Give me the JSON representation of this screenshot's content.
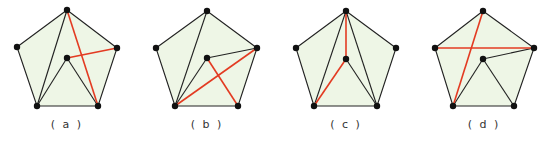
{
  "figure": {
    "colors": {
      "fill": "#eef6e6",
      "edge": "#222222",
      "highlight": "#e33b22",
      "vertex": "#111111"
    },
    "panels": [
      {
        "label": "(a)",
        "label_pos": [
          67,
          128
        ],
        "vertices": {
          "top": [
            67,
            10
          ],
          "left": [
            17,
            47
          ],
          "right": [
            117,
            48
          ],
          "inner": [
            67,
            58
          ],
          "bl": [
            37,
            106
          ],
          "br": [
            98,
            106
          ]
        },
        "polygon": [
          "top",
          "right",
          "br",
          "bl",
          "left"
        ],
        "edges": [
          [
            "top",
            "bl"
          ],
          [
            "inner",
            "bl"
          ],
          [
            "inner",
            "br"
          ]
        ],
        "red_edges": [
          [
            "top",
            "br"
          ],
          [
            "inner",
            "right"
          ]
        ]
      },
      {
        "label": "(b)",
        "label_pos": [
          207,
          128
        ],
        "vertices": {
          "top": [
            207,
            11
          ],
          "left": [
            156,
            48
          ],
          "right": [
            257,
            48
          ],
          "inner": [
            207,
            58
          ],
          "bl": [
            175,
            106
          ],
          "br": [
            238,
            106
          ]
        },
        "polygon": [
          "top",
          "right",
          "br",
          "bl",
          "left"
        ],
        "edges": [
          [
            "top",
            "bl"
          ],
          [
            "inner",
            "bl"
          ],
          [
            "inner",
            "right"
          ]
        ],
        "red_edges": [
          [
            "bl",
            "right"
          ],
          [
            "inner",
            "br"
          ]
        ]
      },
      {
        "label": "(c)",
        "label_pos": [
          346,
          128
        ],
        "vertices": {
          "top": [
            346,
            11
          ],
          "left": [
            296,
            48
          ],
          "right": [
            396,
            48
          ],
          "inner": [
            346,
            59
          ],
          "bl": [
            314,
            106
          ],
          "br": [
            377,
            106
          ]
        },
        "polygon": [
          "top",
          "right",
          "br",
          "bl",
          "left"
        ],
        "edges": [
          [
            "top",
            "bl"
          ],
          [
            "top",
            "br"
          ],
          [
            "inner",
            "br"
          ]
        ],
        "red_edges": [
          [
            "top",
            "inner"
          ],
          [
            "inner",
            "bl"
          ]
        ]
      },
      {
        "label": "(d)",
        "label_pos": [
          484,
          128
        ],
        "vertices": {
          "top": [
            483,
            11
          ],
          "left": [
            435,
            48
          ],
          "right": [
            534,
            48
          ],
          "inner": [
            483,
            59
          ],
          "bl": [
            453,
            106
          ],
          "br": [
            514,
            106
          ]
        },
        "polygon": [
          "top",
          "right",
          "br",
          "bl",
          "left"
        ],
        "edges": [
          [
            "inner",
            "right"
          ],
          [
            "inner",
            "bl"
          ],
          [
            "inner",
            "br"
          ]
        ],
        "red_edges": [
          [
            "top",
            "bl"
          ],
          [
            "left",
            "right"
          ]
        ]
      }
    ]
  }
}
